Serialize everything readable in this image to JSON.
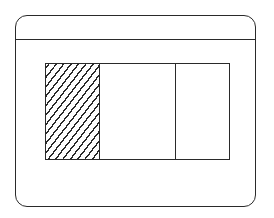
{
  "diagram": {
    "type": "window-layout-wireframe",
    "frame": {
      "shape": "rounded-rectangle",
      "has_title_bar": true
    },
    "content_area": {
      "panes": [
        {
          "id": "left",
          "fill": "diagonal-hatch"
        },
        {
          "id": "middle",
          "fill": "none"
        },
        {
          "id": "right",
          "fill": "none"
        }
      ]
    },
    "colors": {
      "stroke": "#2a2a2a",
      "background": "#ffffff"
    }
  }
}
